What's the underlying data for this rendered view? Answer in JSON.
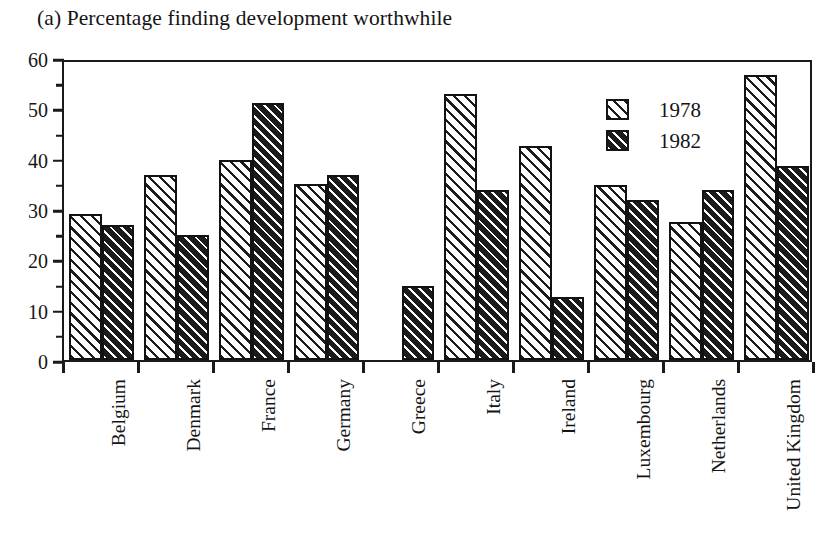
{
  "chart_data": {
    "type": "bar",
    "title": "(a) Percentage finding development worthwhile",
    "xlabel": "",
    "ylabel": "",
    "ylim": [
      0,
      60
    ],
    "ytick_step": 10,
    "yticks": [
      "0",
      "10",
      "20",
      "30",
      "40",
      "50",
      "60"
    ],
    "grid": false,
    "legend_position": "top-right",
    "categories": [
      "Belgium",
      "Denmark",
      "France",
      "Germany",
      "Greece",
      "Italy",
      "Ireland",
      "Luxembourg",
      "Netherlands",
      "United Kingdom"
    ],
    "series": [
      {
        "name": "1978",
        "values": [
          29.0,
          36.8,
          39.8,
          35.0,
          null,
          52.8,
          42.5,
          34.7,
          27.5,
          56.7
        ]
      },
      {
        "name": "1982",
        "values": [
          26.8,
          24.8,
          51.0,
          36.8,
          14.7,
          33.8,
          12.5,
          31.8,
          33.7,
          38.5
        ]
      }
    ]
  },
  "legend": {
    "entries": [
      {
        "label": "1978",
        "swatch": "light-diagonal-hatch"
      },
      {
        "label": "1982",
        "swatch": "dark-diagonal-hatch"
      }
    ]
  },
  "axes": {
    "y_min_label": "0",
    "y_max_label": "60"
  }
}
